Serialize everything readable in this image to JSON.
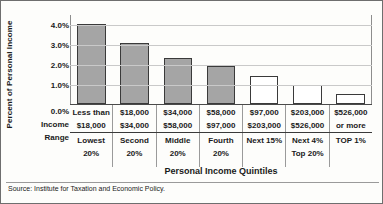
{
  "chart_data": {
    "type": "bar",
    "title": "",
    "xlabel": "Personal Income Quintiles",
    "ylabel": "Percent of Personal Income",
    "ylim": [
      0.0,
      4.5
    ],
    "grid": true,
    "legend": "none",
    "categories": [
      "Lowest 20%",
      "Second 20%",
      "Middle 20%",
      "Fourth 20%",
      "Next 15%",
      "Next 4% Top 20%",
      "TOP 1%"
    ],
    "values": [
      4.0,
      3.05,
      2.3,
      1.9,
      1.4,
      0.95,
      0.5
    ],
    "ytick_labels": [
      "4.0%",
      "3.0%",
      "2.0%",
      "1.0%",
      "0.0%"
    ],
    "ytick_values": [
      4.0,
      3.0,
      2.0,
      1.0,
      0.0
    ],
    "bar_styles": [
      "filled",
      "filled",
      "filled",
      "filled",
      "hollow",
      "hollow",
      "hollow"
    ],
    "colors": {
      "bar_fill": "#a5a5a5",
      "bar_hollow": "#ffffff",
      "bar_edge": "#3a3a3a",
      "grid": "#c9c9c9",
      "text": "#1a1a1a"
    }
  },
  "axis": {
    "y_title": "Percent of Personal Income",
    "x_title": "Personal Income Quintiles"
  },
  "row_labels": {
    "income": "Income",
    "range": "Range",
    "zero_tick": "0.0%"
  },
  "table": {
    "income_ranges": [
      {
        "line1": "Less than",
        "line2": "$18,000"
      },
      {
        "line1": "$18,000",
        "line2": "$34,000"
      },
      {
        "line1": "$34,000",
        "line2": "$58,000"
      },
      {
        "line1": "$58,000",
        "line2": "$97,000"
      },
      {
        "line1": "$97,000",
        "line2": "$203,000"
      },
      {
        "line1": "$203,000",
        "line2": "$526,000"
      },
      {
        "line1": "$526,000",
        "line2": "or more"
      }
    ],
    "quintiles": [
      {
        "line1": "Lowest",
        "line2": "20%"
      },
      {
        "line1": "Second",
        "line2": "20%"
      },
      {
        "line1": "Middle",
        "line2": "20%"
      },
      {
        "line1": "Fourth",
        "line2": "20%"
      },
      {
        "line1": "Next 15%",
        "line2": ""
      },
      {
        "line1": "Next 4%",
        "line2": "Top 20%"
      },
      {
        "line1": "TOP 1%",
        "line2": ""
      }
    ]
  },
  "source": "Source: Institute for Taxation and Economic Policy."
}
